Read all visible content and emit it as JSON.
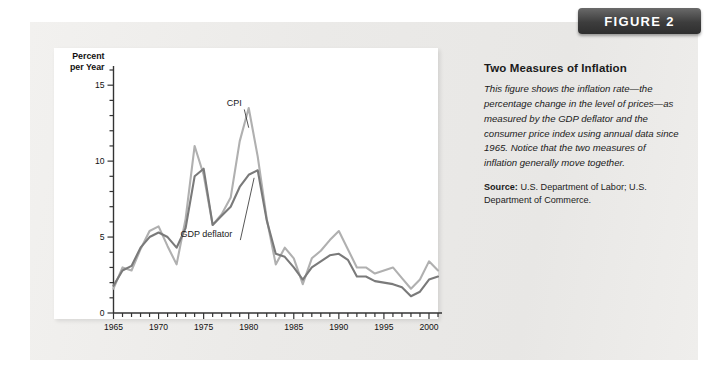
{
  "badge": {
    "label": "FIGURE 2"
  },
  "caption": {
    "title": "Two Measures of Inflation",
    "body": "This figure shows the inflation rate—the percentage change in the level of prices—as measured by the GDP deflator and the consumer price index using annual data since 1965. Notice that the two measures of inflation generally move together.",
    "source_label": "Source:",
    "source_text": " U.S. Department of Labor; U.S. Department of Commerce."
  },
  "colors": {
    "cpi": "#b0b0b0",
    "gdp_deflator": "#7a7a7a",
    "axis": "#333333",
    "panel": "#ffffff",
    "card": "#ecebe9",
    "badge": "#3d3d3d"
  },
  "chart_data": {
    "type": "line",
    "title": "Two Measures of Inflation",
    "xlabel": "",
    "ylabel": "Percent per Year",
    "ylabel_lines": [
      "Percent",
      "per Year"
    ],
    "xlim": [
      1965,
      2001
    ],
    "ylim": [
      0,
      16
    ],
    "yticks": [
      0,
      5,
      10,
      15
    ],
    "ytick_labels": [
      "0",
      "5",
      "10",
      "15"
    ],
    "y_minor_step": 1,
    "xticks": [
      1965,
      1970,
      1975,
      1980,
      1985,
      1990,
      1995,
      2000
    ],
    "xtick_labels": [
      "1965",
      "1970",
      "1975",
      "1980",
      "1985",
      "1990",
      "1995",
      "2000"
    ],
    "x_minor_step": 1,
    "grid": false,
    "legend": "inline-annotations",
    "annotations": [
      {
        "text": "CPI",
        "x": 1978.4,
        "y": 13.6,
        "points_to_x": 1980.0,
        "points_to_y": 12.2
      },
      {
        "text": "GDP deflator",
        "x": 1975.3,
        "y": 5.0,
        "points_to_x": 1980.6,
        "points_to_y": 8.9
      }
    ],
    "x": [
      1965,
      1966,
      1967,
      1968,
      1969,
      1970,
      1971,
      1972,
      1973,
      1974,
      1975,
      1976,
      1977,
      1978,
      1979,
      1980,
      1981,
      1982,
      1983,
      1984,
      1985,
      1986,
      1987,
      1988,
      1989,
      1990,
      1991,
      1992,
      1993,
      1994,
      1995,
      1996,
      1997,
      1998,
      1999,
      2000,
      2001
    ],
    "series": [
      {
        "name": "CPI",
        "color": "#b0b0b0",
        "values": [
          1.6,
          3.0,
          2.8,
          4.2,
          5.4,
          5.7,
          4.4,
          3.2,
          6.2,
          11.0,
          9.1,
          5.8,
          6.5,
          7.6,
          11.3,
          13.5,
          10.3,
          6.2,
          3.2,
          4.3,
          3.6,
          1.9,
          3.6,
          4.1,
          4.8,
          5.4,
          4.2,
          3.0,
          3.0,
          2.6,
          2.8,
          3.0,
          2.3,
          1.6,
          2.2,
          3.4,
          2.8
        ]
      },
      {
        "name": "GDP deflator",
        "color": "#7a7a7a",
        "values": [
          1.8,
          2.8,
          3.1,
          4.3,
          5.0,
          5.3,
          5.0,
          4.3,
          5.6,
          9.0,
          9.5,
          5.8,
          6.4,
          7.0,
          8.3,
          9.1,
          9.4,
          6.1,
          3.9,
          3.7,
          3.0,
          2.2,
          3.0,
          3.4,
          3.8,
          3.9,
          3.5,
          2.4,
          2.4,
          2.1,
          2.0,
          1.9,
          1.7,
          1.1,
          1.4,
          2.2,
          2.4
        ]
      }
    ]
  }
}
